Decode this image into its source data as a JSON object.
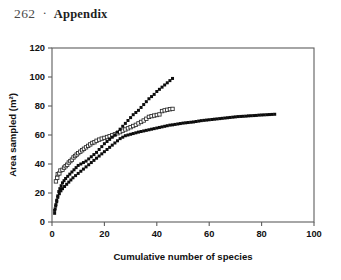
{
  "page": {
    "folio": "262",
    "separator": "·",
    "running_title": "Appendix"
  },
  "chart_data": {
    "type": "scatter",
    "title": "",
    "xlabel": "Cumulative number of species",
    "ylabel": "Area sampled (m²)",
    "xlim": [
      0,
      100
    ],
    "ylim": [
      0,
      120
    ],
    "xticks": [
      0,
      20,
      40,
      60,
      80,
      100
    ],
    "yticks": [
      0,
      20,
      40,
      60,
      80,
      100,
      120
    ],
    "grid": false,
    "legend": "none",
    "frame": "full-box",
    "marker_colors": {
      "filled": "#0d0d0d",
      "open_fill": "#ffffff",
      "open_stroke": "#2a2a2a"
    },
    "series": [
      {
        "name": "Site A (open squares)",
        "marker": "open-square",
        "points": [
          [
            1.5,
            28.0
          ],
          [
            2.0,
            30.5
          ],
          [
            2.2,
            33.0
          ],
          [
            2.8,
            33.5
          ],
          [
            3.2,
            35.5
          ],
          [
            4.0,
            36.0
          ],
          [
            4.6,
            37.5
          ],
          [
            5.2,
            38.5
          ],
          [
            5.8,
            39.5
          ],
          [
            6.4,
            41.0
          ],
          [
            7.0,
            42.0
          ],
          [
            7.6,
            43.0
          ],
          [
            8.2,
            44.5
          ],
          [
            8.8,
            45.5
          ],
          [
            9.4,
            46.5
          ],
          [
            10.0,
            47.5
          ],
          [
            10.8,
            48.5
          ],
          [
            11.5,
            49.5
          ],
          [
            12.2,
            50.5
          ],
          [
            13.0,
            51.5
          ],
          [
            13.8,
            52.5
          ],
          [
            14.6,
            53.5
          ],
          [
            15.4,
            54.5
          ],
          [
            16.2,
            55.0
          ],
          [
            17.0,
            56.0
          ],
          [
            18.0,
            56.8
          ],
          [
            19.0,
            57.5
          ],
          [
            20.0,
            58.0
          ],
          [
            21.0,
            58.6
          ],
          [
            22.0,
            59.2
          ],
          [
            23.0,
            59.8
          ],
          [
            24.0,
            60.5
          ],
          [
            25.0,
            61.2
          ],
          [
            26.0,
            62.0
          ],
          [
            27.0,
            63.0
          ],
          [
            28.0,
            63.8
          ],
          [
            29.0,
            64.6
          ],
          [
            30.0,
            65.4
          ],
          [
            31.0,
            66.2
          ],
          [
            32.0,
            67.0
          ],
          [
            33.0,
            68.0
          ],
          [
            34.0,
            69.0
          ],
          [
            35.0,
            70.0
          ],
          [
            36.0,
            71.2
          ],
          [
            37.0,
            72.5
          ],
          [
            38.0,
            73.0
          ],
          [
            39.0,
            73.4
          ],
          [
            40.0,
            73.8
          ],
          [
            41.0,
            74.2
          ],
          [
            42.0,
            76.5
          ],
          [
            43.0,
            77.0
          ],
          [
            44.0,
            77.4
          ],
          [
            45.0,
            77.8
          ],
          [
            46.0,
            78.0
          ]
        ]
      },
      {
        "name": "Site B (filled squares, steep)",
        "marker": "filled-square",
        "points": [
          [
            1.0,
            6.0
          ],
          [
            1.2,
            9.0
          ],
          [
            1.5,
            12.0
          ],
          [
            1.8,
            15.0
          ],
          [
            2.2,
            18.0
          ],
          [
            2.6,
            21.0
          ],
          [
            3.0,
            23.0
          ],
          [
            3.5,
            25.0
          ],
          [
            4.0,
            27.0
          ],
          [
            4.6,
            28.5
          ],
          [
            5.2,
            30.0
          ],
          [
            6.0,
            31.5
          ],
          [
            6.8,
            33.0
          ],
          [
            7.6,
            34.5
          ],
          [
            8.4,
            36.0
          ],
          [
            9.2,
            37.5
          ],
          [
            10.0,
            39.0
          ],
          [
            11.0,
            40.0
          ],
          [
            12.0,
            41.0
          ],
          [
            13.0,
            42.0
          ],
          [
            14.0,
            43.5
          ],
          [
            15.0,
            45.0
          ],
          [
            16.0,
            46.5
          ],
          [
            17.0,
            48.0
          ],
          [
            18.0,
            50.0
          ],
          [
            19.0,
            52.0
          ],
          [
            20.0,
            54.0
          ],
          [
            21.0,
            55.5
          ],
          [
            22.0,
            57.0
          ],
          [
            23.0,
            58.5
          ],
          [
            24.0,
            60.0
          ],
          [
            25.0,
            62.0
          ],
          [
            26.0,
            64.0
          ],
          [
            27.0,
            66.0
          ],
          [
            28.0,
            68.0
          ],
          [
            29.0,
            70.0
          ],
          [
            30.0,
            72.0
          ],
          [
            31.0,
            74.0
          ],
          [
            32.0,
            75.5
          ],
          [
            33.0,
            77.0
          ],
          [
            34.0,
            79.0
          ],
          [
            35.0,
            81.0
          ],
          [
            36.0,
            83.0
          ],
          [
            37.0,
            85.0
          ],
          [
            38.0,
            86.5
          ],
          [
            39.0,
            88.0
          ],
          [
            40.0,
            90.0
          ],
          [
            41.0,
            91.5
          ],
          [
            42.0,
            93.0
          ],
          [
            43.0,
            94.5
          ],
          [
            44.0,
            96.0
          ],
          [
            45.0,
            97.5
          ],
          [
            46.0,
            99.0
          ]
        ]
      },
      {
        "name": "Site C (filled squares, long tail)",
        "marker": "filled-square",
        "points": [
          [
            1.0,
            8.0
          ],
          [
            1.4,
            11.0
          ],
          [
            1.8,
            14.0
          ],
          [
            2.2,
            17.0
          ],
          [
            2.8,
            19.5
          ],
          [
            3.4,
            21.5
          ],
          [
            4.0,
            23.0
          ],
          [
            4.8,
            24.5
          ],
          [
            5.6,
            26.0
          ],
          [
            6.4,
            27.5
          ],
          [
            7.2,
            29.0
          ],
          [
            8.0,
            30.5
          ],
          [
            9.0,
            32.0
          ],
          [
            10.0,
            33.5
          ],
          [
            11.0,
            35.0
          ],
          [
            12.0,
            36.5
          ],
          [
            13.0,
            38.0
          ],
          [
            14.0,
            39.5
          ],
          [
            15.0,
            41.0
          ],
          [
            16.0,
            42.5
          ],
          [
            17.0,
            44.0
          ],
          [
            18.0,
            45.5
          ],
          [
            19.0,
            47.0
          ],
          [
            20.0,
            48.5
          ],
          [
            21.0,
            50.0
          ],
          [
            22.0,
            51.5
          ],
          [
            23.0,
            53.0
          ],
          [
            24.0,
            54.5
          ],
          [
            25.0,
            56.0
          ],
          [
            26.0,
            57.5
          ],
          [
            27.0,
            58.5
          ],
          [
            28.0,
            59.5
          ],
          [
            29.0,
            60.0
          ],
          [
            30.0,
            60.5
          ],
          [
            31.0,
            61.0
          ],
          [
            32.0,
            61.5
          ],
          [
            33.0,
            62.0
          ],
          [
            34.0,
            62.4
          ],
          [
            35.0,
            62.8
          ],
          [
            36.0,
            63.2
          ],
          [
            37.0,
            63.6
          ],
          [
            38.0,
            64.0
          ],
          [
            39.0,
            64.4
          ],
          [
            40.0,
            64.8
          ],
          [
            41.0,
            65.2
          ],
          [
            42.0,
            65.6
          ],
          [
            43.0,
            66.0
          ],
          [
            44.0,
            66.4
          ],
          [
            45.0,
            66.8
          ],
          [
            46.0,
            67.0
          ],
          [
            47.0,
            67.3
          ],
          [
            48.0,
            67.6
          ],
          [
            49.0,
            67.9
          ],
          [
            50.0,
            68.2
          ],
          [
            51.0,
            68.4
          ],
          [
            52.0,
            68.6
          ],
          [
            53.0,
            68.8
          ],
          [
            54.0,
            69.0
          ],
          [
            55.0,
            69.3
          ],
          [
            56.0,
            69.6
          ],
          [
            57.0,
            69.9
          ],
          [
            58.0,
            70.1
          ],
          [
            59.0,
            70.3
          ],
          [
            60.0,
            70.5
          ],
          [
            61.0,
            70.7
          ],
          [
            62.0,
            70.9
          ],
          [
            63.0,
            71.1
          ],
          [
            64.0,
            71.3
          ],
          [
            65.0,
            71.5
          ],
          [
            66.0,
            71.7
          ],
          [
            67.0,
            71.9
          ],
          [
            68.0,
            72.1
          ],
          [
            69.0,
            72.3
          ],
          [
            70.0,
            72.5
          ],
          [
            71.0,
            72.7
          ],
          [
            72.0,
            72.8
          ],
          [
            73.0,
            72.9
          ],
          [
            74.0,
            73.0
          ],
          [
            75.0,
            73.2
          ],
          [
            76.0,
            73.3
          ],
          [
            77.0,
            73.4
          ],
          [
            78.0,
            73.5
          ],
          [
            79.0,
            73.7
          ],
          [
            80.0,
            73.8
          ],
          [
            81.0,
            73.9
          ],
          [
            82.0,
            74.0
          ],
          [
            83.0,
            74.1
          ],
          [
            84.0,
            74.2
          ],
          [
            85.0,
            74.3
          ]
        ]
      }
    ]
  }
}
